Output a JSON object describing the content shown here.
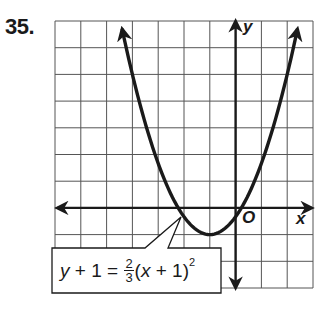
{
  "problem": {
    "number": "35."
  },
  "axes": {
    "x_label": "x",
    "y_label": "y",
    "origin_label": "O"
  },
  "equation": {
    "lhs_var": "y",
    "lhs_rest": " + 1 = ",
    "frac_num": "2",
    "frac_den": "3",
    "paren_open": "(",
    "rhs_var": "x",
    "rhs_rest": " + 1)",
    "exponent": "2",
    "full_text": "y + 1 = 2/3(x + 1)^2"
  },
  "colors": {
    "ink": "#1a1a1a",
    "grid": "#555555",
    "background": "#ffffff"
  },
  "chart_data": {
    "type": "line",
    "title": "35.",
    "xlabel": "x",
    "ylabel": "y",
    "xlim": [
      -7,
      3
    ],
    "ylim": [
      -3,
      7
    ],
    "grid": true,
    "grid_step": 1,
    "legend": "none",
    "annotations": [
      {
        "text": "y + 1 = 2/3(x + 1)^2",
        "position": "bottom-left callout box pointing to curve near x-intercept (-2.2, 0)"
      },
      {
        "text": "O",
        "position": "origin label, below-right of origin"
      }
    ],
    "series": [
      {
        "name": "y + 1 = 2/3(x + 1)^2",
        "equation": "y = (2/3)(x + 1)^2 - 1",
        "vertex": [
          -1,
          -1
        ],
        "x_intercepts": [
          -2.22,
          0.22
        ],
        "y_intercept": -0.33,
        "x": [
          -4.4,
          -4,
          -3.5,
          -3,
          -2.5,
          -2,
          -1.5,
          -1,
          -0.5,
          0,
          0.5,
          1,
          1.5,
          2,
          2.4
        ],
        "y": [
          6.71,
          5.0,
          3.17,
          1.67,
          0.5,
          -0.33,
          -0.83,
          -1.0,
          -0.83,
          -0.33,
          0.5,
          1.67,
          3.17,
          5.0,
          6.71
        ],
        "arrows_both_ends": true
      }
    ]
  }
}
